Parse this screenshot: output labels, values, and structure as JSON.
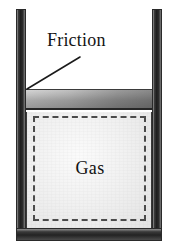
{
  "figure": {
    "width": 180,
    "height": 250,
    "background": "#ffffff"
  },
  "labels": {
    "friction": "Friction",
    "gas": "Gas"
  },
  "callout": {
    "name": "friction-leader-line",
    "from_x": 80,
    "from_y": 57,
    "to_x": 27,
    "to_y": 89,
    "color": "#1b1b1b",
    "width": 1.6
  },
  "parts": {
    "wall_left": {
      "label": "cylinder-left-wall",
      "x": 16,
      "y": 9,
      "w": 10,
      "h": 232
    },
    "wall_right": {
      "label": "cylinder-right-wall",
      "x": 152,
      "y": 9,
      "w": 10,
      "h": 232
    },
    "wall_bottom": {
      "label": "cylinder-base",
      "x": 16,
      "y": 228,
      "w": 146,
      "h": 13
    },
    "piston": {
      "label": "piston-block",
      "x": 26,
      "y": 89,
      "w": 126,
      "h": 21
    },
    "chamber": {
      "label": "gas-chamber",
      "x": 26,
      "y": 112,
      "w": 126,
      "h": 116
    },
    "gas_boundary": {
      "label": "gas-dashed-boundary",
      "style": "dashed"
    }
  },
  "colors": {
    "wall_dark": "#1e1e1e",
    "wall_light": "#9a9a9a",
    "piston_light": "#e2e2e2",
    "piston_dark": "#9c9c9c",
    "chamber_fill": "#f1f1f1",
    "dash_stroke": "#4b4b4b",
    "text": "#141414"
  }
}
